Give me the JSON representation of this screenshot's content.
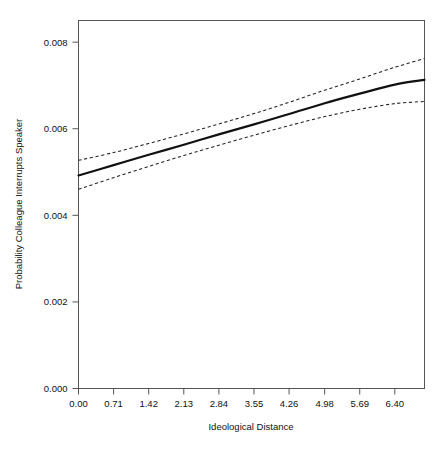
{
  "chart_data": {
    "type": "line",
    "title": "",
    "xlabel": "Ideological Distance",
    "ylabel": "Probability Colleague Interrupts Speaker",
    "xlim": [
      0.0,
      7.0
    ],
    "ylim": [
      0.0,
      0.0085
    ],
    "grid": false,
    "legend": null,
    "xticks": [
      "0.00",
      "0.71",
      "1.42",
      "2.13",
      "2.84",
      "3.55",
      "4.26",
      "4.98",
      "5.69",
      "6.40"
    ],
    "xtick_values": [
      0.0,
      0.71,
      1.42,
      2.13,
      2.84,
      3.55,
      4.26,
      4.98,
      5.69,
      6.4
    ],
    "yticks": [
      "0.000",
      "0.002",
      "0.004",
      "0.006",
      "0.008"
    ],
    "ytick_values": [
      0.0,
      0.002,
      0.004,
      0.006,
      0.008
    ],
    "x": [
      0.0,
      0.71,
      1.42,
      2.13,
      2.84,
      3.55,
      4.26,
      4.98,
      5.69,
      6.4,
      7.0
    ],
    "series": [
      {
        "name": "Predicted probability",
        "style": "solid",
        "color": "#111111",
        "values": [
          0.00492,
          0.00516,
          0.0054,
          0.00563,
          0.00587,
          0.0061,
          0.00634,
          0.00659,
          0.00681,
          0.00702,
          0.00713
        ]
      },
      {
        "name": "Upper 95% confidence bound",
        "style": "dashed",
        "color": "#222222",
        "values": [
          0.00527,
          0.00545,
          0.00566,
          0.00588,
          0.00611,
          0.00635,
          0.00661,
          0.00689,
          0.00715,
          0.00742,
          0.00762
        ]
      },
      {
        "name": "Lower 95% confidence bound",
        "style": "dashed",
        "color": "#222222",
        "values": [
          0.0046,
          0.00487,
          0.00513,
          0.00538,
          0.00562,
          0.00585,
          0.00607,
          0.00628,
          0.00645,
          0.00658,
          0.00663
        ]
      }
    ]
  }
}
